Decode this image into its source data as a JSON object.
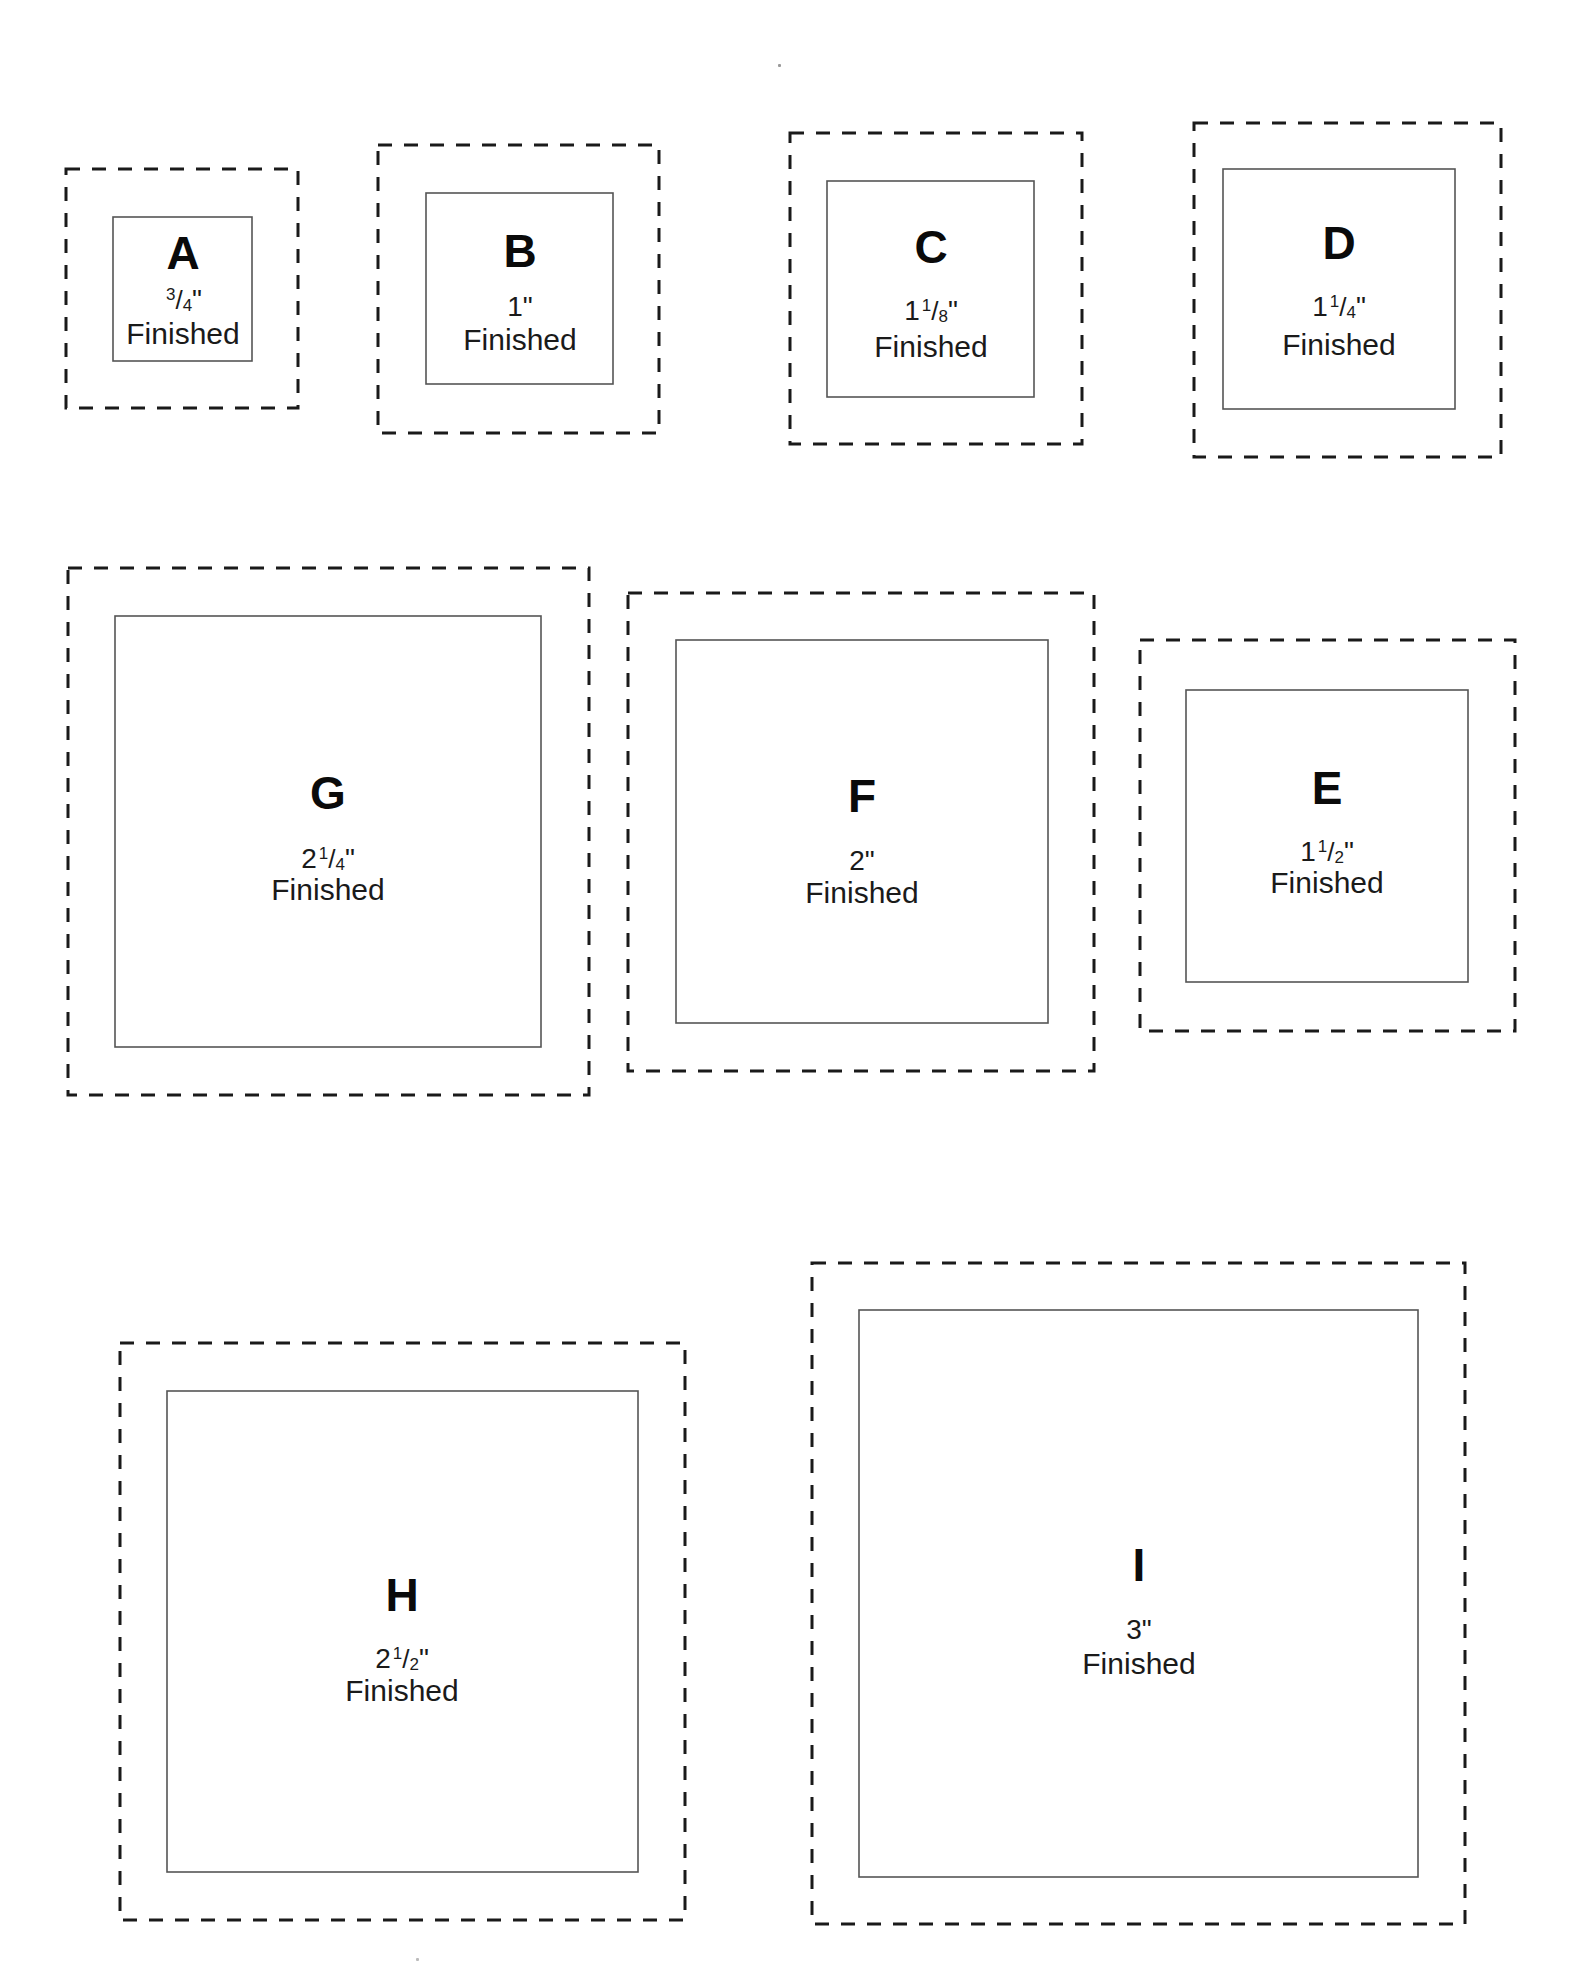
{
  "page": {
    "word_finished": "Finished"
  },
  "squares": [
    {
      "id": "A",
      "letter": "A",
      "size_label": "3/4\"",
      "whole": "",
      "num": "3",
      "den": "4",
      "dashed": [
        66,
        169,
        298,
        408
      ],
      "inner": [
        113,
        217,
        252,
        361
      ],
      "cx": 183,
      "ly": 253,
      "sy": 300,
      "fy": 334
    },
    {
      "id": "B",
      "letter": "B",
      "size_label": "1\"",
      "whole": "1",
      "num": "",
      "den": "",
      "dashed": [
        378,
        145,
        659,
        433
      ],
      "inner": [
        426,
        193,
        613,
        384
      ],
      "cx": 520,
      "ly": 251,
      "sy": 307,
      "fy": 340
    },
    {
      "id": "C",
      "letter": "C",
      "size_label": "1 1/8\"",
      "whole": "1",
      "num": "1",
      "den": "8",
      "dashed": [
        790,
        133,
        1082,
        444
      ],
      "inner": [
        827,
        181,
        1034,
        397
      ],
      "cx": 931,
      "ly": 247,
      "sy": 311,
      "fy": 347
    },
    {
      "id": "D",
      "letter": "D",
      "size_label": "1 1/4\"",
      "whole": "1",
      "num": "1",
      "den": "4",
      "dashed": [
        1194,
        123,
        1501,
        457
      ],
      "inner": [
        1223,
        169,
        1455,
        409
      ],
      "cx": 1339,
      "ly": 243,
      "sy": 307,
      "fy": 345
    },
    {
      "id": "G",
      "letter": "G",
      "size_label": "2 1/4\"",
      "whole": "2",
      "num": "1",
      "den": "4",
      "dashed": [
        68,
        568,
        589,
        1095
      ],
      "inner": [
        115,
        616,
        541,
        1047
      ],
      "cx": 328,
      "ly": 793,
      "sy": 859,
      "fy": 890
    },
    {
      "id": "F",
      "letter": "F",
      "size_label": "2\"",
      "whole": "2",
      "num": "",
      "den": "",
      "dashed": [
        628,
        593,
        1094,
        1071
      ],
      "inner": [
        676,
        640,
        1048,
        1023
      ],
      "cx": 862,
      "ly": 796,
      "sy": 861,
      "fy": 893
    },
    {
      "id": "E",
      "letter": "E",
      "size_label": "1 1/2\"",
      "whole": "1",
      "num": "1",
      "den": "2",
      "dashed": [
        1140,
        640,
        1515,
        1031
      ],
      "inner": [
        1186,
        690,
        1468,
        982
      ],
      "cx": 1327,
      "ly": 788,
      "sy": 852,
      "fy": 883
    },
    {
      "id": "H",
      "letter": "H",
      "size_label": "2 1/2\"",
      "whole": "2",
      "num": "1",
      "den": "2",
      "dashed": [
        120,
        1343,
        685,
        1920
      ],
      "inner": [
        167,
        1391,
        638,
        1872
      ],
      "cx": 402,
      "ly": 1595,
      "sy": 1659,
      "fy": 1691
    },
    {
      "id": "I",
      "letter": "I",
      "size_label": "3\"",
      "whole": "3",
      "num": "",
      "den": "",
      "dashed": [
        812,
        1263,
        1465,
        1924
      ],
      "inner": [
        859,
        1310,
        1418,
        1877
      ],
      "cx": 1139,
      "ly": 1565,
      "sy": 1630,
      "fy": 1664
    }
  ],
  "style": {
    "dashed_stroke": "#1a1a1a",
    "inner_stroke": "#555555",
    "background": "#ffffff"
  }
}
